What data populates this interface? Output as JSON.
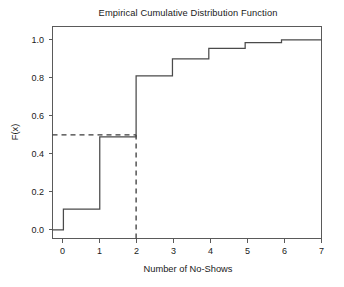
{
  "chart_data": {
    "type": "line",
    "subtype": "step-ecdf",
    "title": "Empirical Cumulative Distribution Function",
    "xlabel": "Number of No-Shows",
    "ylabel": "F(x)",
    "x": [
      0,
      1,
      2,
      3,
      4,
      5,
      6,
      7
    ],
    "values": [
      0.11,
      0.49,
      0.81,
      0.9,
      0.955,
      0.985,
      1.0,
      1.0
    ],
    "series": [
      {
        "name": "ECDF",
        "x": [
          0,
          1,
          2,
          3,
          4,
          5,
          6,
          7
        ],
        "values": [
          0.11,
          0.49,
          0.81,
          0.9,
          0.955,
          0.985,
          1.0,
          1.0
        ]
      }
    ],
    "baseline_value": 0.0,
    "xlim": [
      -0.3,
      7.1
    ],
    "ylim": [
      -0.045,
      1.07
    ],
    "xticks": [
      0,
      1,
      2,
      3,
      4,
      5,
      6,
      7
    ],
    "xticklabels": [
      "0",
      "1",
      "2",
      "3",
      "4",
      "5",
      "6",
      "7"
    ],
    "yticks": [
      0.0,
      0.2,
      0.4,
      0.6,
      0.8,
      1.0
    ],
    "yticklabels": [
      "0.0",
      "0.2",
      "0.4",
      "0.6",
      "0.8",
      "1.0"
    ],
    "grid": false,
    "legend": false,
    "legend_position": "none",
    "annotations": [
      {
        "name": "median-horizontal-reference",
        "type": "dashed-horizontal-line",
        "y": 0.5,
        "x_from": -0.3,
        "x_to": 2.0
      },
      {
        "name": "median-vertical-reference",
        "type": "dashed-vertical-line",
        "x": 2.0,
        "y_from": -0.045,
        "y_to": 0.5
      }
    ],
    "colors": {
      "line": "#4a4a4a",
      "reference": "#3a3a3a",
      "frame": "#5a5a5a",
      "background": "#ffffff",
      "text": "#1a1a1a"
    }
  }
}
